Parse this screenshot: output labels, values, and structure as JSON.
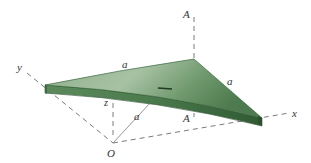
{
  "figure": {
    "colors": {
      "plate_top": "#5f8a5f",
      "plate_top_light": "#9cb89a",
      "plate_edge": "#3d6a40",
      "plate_edge_dark": "#2c4f2f",
      "axis_dash": "#777777",
      "label": "#333333"
    }
  },
  "labels": {
    "axis_x": "x",
    "axis_y": "y",
    "axis_z": "z",
    "origin": "O",
    "section_top": "A",
    "section_bottom": "A",
    "dim_left_edge": "a",
    "dim_right_edge": "a",
    "dim_radius": "a"
  }
}
